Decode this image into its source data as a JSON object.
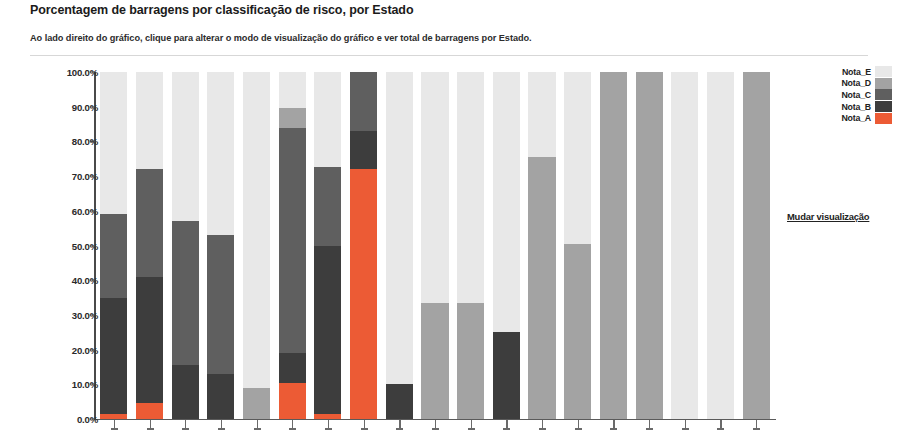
{
  "header": {
    "title": "Porcentagem de barragens por classificação de risco, por Estado",
    "subtitle": "Ao lado direito do gráfico, clique para alterar o modo de visualização do gráfico e ver total de barragens por Estado."
  },
  "actions": {
    "change_view_label": "Mudar visualização"
  },
  "colors": {
    "Nota_A": "#ec5b35",
    "Nota_B": "#3d3d3d",
    "Nota_C": "#5f5f5f",
    "Nota_D": "#a3a3a3",
    "Nota_E": "#e8e8e8",
    "axis": "#4a4a4a",
    "rule": "#d7d7d7",
    "text": "#1b1b1b"
  },
  "chart_data": {
    "type": "bar",
    "title": "Porcentagem de barragens por classificação de risco, por Estado",
    "subtitle": "Ao lado direito do gráfico, clique para alterar o modo de visualização do gráfico e ver total de barragens por Estado.",
    "stacked": true,
    "normalized_100pct": true,
    "xlabel": "",
    "ylabel": "",
    "ylim": [
      0,
      100
    ],
    "ytick_labels": [
      "100.0%",
      "90.0%",
      "80.0%",
      "70.0%",
      "60.0%",
      "50.0%",
      "40.0%",
      "30.0%",
      "20.0%",
      "10.0%",
      "0.0%"
    ],
    "ytick_values": [
      100,
      90,
      80,
      70,
      60,
      50,
      40,
      30,
      20,
      10,
      0
    ],
    "grid": false,
    "legend_position": "right",
    "legend_entries": [
      "Nota_E",
      "Nota_D",
      "Nota_C",
      "Nota_B",
      "Nota_A"
    ],
    "categories": [
      "1",
      "2",
      "3",
      "4",
      "5",
      "6",
      "7",
      "8",
      "9",
      "10",
      "11",
      "12",
      "13",
      "14",
      "15",
      "16",
      "17",
      "18",
      "19"
    ],
    "category_labels_visible": false,
    "series": [
      {
        "name": "Nota_A",
        "color": "#ec5b35",
        "values": [
          1.5,
          4.5,
          0,
          0,
          0,
          10.5,
          1.5,
          72.0,
          0,
          0,
          0,
          0,
          0,
          0,
          0,
          0,
          0,
          0,
          0
        ]
      },
      {
        "name": "Nota_B",
        "color": "#3d3d3d",
        "values": [
          33.5,
          36.5,
          15.5,
          13.0,
          0,
          8.5,
          48.5,
          11.0,
          10.0,
          0,
          0,
          25.0,
          0,
          0,
          0,
          0,
          0,
          0,
          0
        ]
      },
      {
        "name": "Nota_C",
        "color": "#5f5f5f",
        "values": [
          24.0,
          31.0,
          41.5,
          40.0,
          0,
          65.0,
          22.5,
          17.0,
          0,
          0,
          0,
          0,
          0,
          0,
          0,
          0,
          0,
          0,
          0
        ]
      },
      {
        "name": "Nota_D",
        "color": "#a3a3a3",
        "values": [
          0,
          0,
          0,
          0,
          9.0,
          5.5,
          0,
          0,
          0,
          33.5,
          33.5,
          0,
          75.5,
          50.5,
          100.0,
          100.0,
          0,
          0,
          100.0
        ]
      },
      {
        "name": "Nota_E",
        "color": "#e8e8e8",
        "values": [
          41.0,
          28.0,
          43.0,
          47.0,
          91.0,
          10.5,
          27.5,
          0,
          90.0,
          66.5,
          66.5,
          75.0,
          24.5,
          49.5,
          0,
          0,
          100.0,
          100.0,
          0
        ]
      }
    ]
  }
}
